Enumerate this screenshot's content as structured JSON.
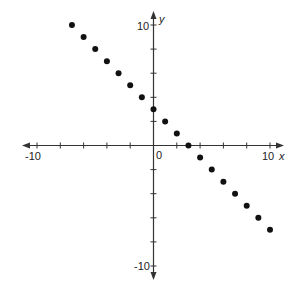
{
  "chart_data": {
    "type": "scatter",
    "title": "",
    "xlabel": "x",
    "ylabel": "y",
    "xlim": [
      -10,
      10
    ],
    "ylim": [
      -10,
      10
    ],
    "grid": false,
    "legend": null,
    "x_tick_step": 2,
    "y_tick_step": 2,
    "tick_labels": {
      "x_min": "-10",
      "x_max": "10",
      "y_min": "-10",
      "y_max": "10",
      "origin": "0"
    },
    "series": [
      {
        "name": "points",
        "color": "#111111",
        "x": [
          -7,
          -6,
          -5,
          -4,
          -3,
          -2,
          -1,
          0,
          1,
          2,
          3,
          4,
          5,
          6,
          7,
          8,
          9,
          10
        ],
        "y": [
          10,
          9,
          8,
          7,
          6,
          5,
          4,
          3,
          2,
          1,
          0,
          -1,
          -2,
          -3,
          -4,
          -5,
          -6,
          -7
        ]
      }
    ]
  },
  "colors": {
    "axis": "#333333",
    "point": "#111111",
    "background": "#ffffff"
  }
}
